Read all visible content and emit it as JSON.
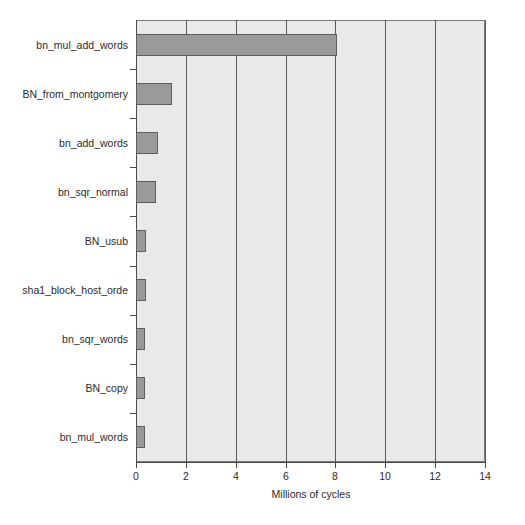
{
  "chart_data": {
    "type": "bar",
    "orientation": "horizontal",
    "title": "",
    "subtitle": "",
    "xlabel": "Millions of cycles",
    "ylabel": "",
    "categories": [
      "bn_mul_add_words",
      "BN_from_montgomery",
      "bn_add_words",
      "bn_sqr_normal",
      "BN_usub",
      "sha1_block_host_orde",
      "bn_sqr_words",
      "BN_copy",
      "bn_mul_words"
    ],
    "values": [
      8.05,
      1.45,
      0.9,
      0.8,
      0.4,
      0.4,
      0.38,
      0.38,
      0.38
    ],
    "xlim": [
      0,
      14
    ],
    "ylim": [
      0,
      9
    ],
    "xticks": [
      0,
      2,
      4,
      6,
      8,
      10,
      12,
      14
    ],
    "xticklabels": [
      "0",
      "2",
      "4",
      "6",
      "8",
      "10",
      "12",
      "14"
    ],
    "grid": "vertical",
    "legend": null,
    "colors": {
      "bar_fill": "#9a9a9a",
      "bar_edge": "#5d5d5d",
      "plot_background": "#e9e9e9",
      "gridline": "#595959",
      "axis": "#4a4a4a",
      "text": "#2b2b2b",
      "figure_background": "#ffffff"
    }
  }
}
